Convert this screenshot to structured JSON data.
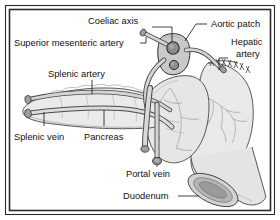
{
  "figure": {
    "kind": "anatomical-illustration",
    "frame": {
      "outer_color": "#2b2b2b",
      "inner_color": "#2b2b2b",
      "background": "#ffffff"
    },
    "palette": {
      "ink": "#111111",
      "outline": "#3c3c3c",
      "organ_fill_light": "#efefef",
      "organ_fill_mid": "#e2e2e2",
      "organ_fill_dark": "#cfcfcf",
      "vessel_fill": "#d8d8d8",
      "patch_fill": "#c6c6c6",
      "lumen_dark": "#8f8f8f"
    }
  },
  "labels": [
    {
      "id": "coeliac-axis",
      "text": "Coeliac axis"
    },
    {
      "id": "aortic-patch",
      "text": "Aortic patch"
    },
    {
      "id": "superior-mesenteric-artery",
      "text": "Superior mesenteric artery"
    },
    {
      "id": "hepatic-artery-line1",
      "text": "Hepatic"
    },
    {
      "id": "hepatic-artery-line2",
      "text": "artery"
    },
    {
      "id": "splenic-artery",
      "text": "Splenic artery"
    },
    {
      "id": "splenic-vein",
      "text": "Splenic vein"
    },
    {
      "id": "pancreas",
      "text": "Pancreas"
    },
    {
      "id": "portal-vein",
      "text": "Portal vein"
    },
    {
      "id": "duodenum",
      "text": "Duodenum"
    }
  ],
  "structures": [
    {
      "id": "pancreas-body",
      "name": "Pancreas body and tail"
    },
    {
      "id": "aortic-patch",
      "name": "Aortic patch with coeliac and SMA ostia"
    },
    {
      "id": "duodenum-loop",
      "name": "Duodenal loop, sutured proximal end, open distal cut end"
    },
    {
      "id": "splenic-vessels",
      "name": "Splenic artery and splenic vein cut stumps"
    },
    {
      "id": "portal-vein",
      "name": "Portal vein cut stump"
    },
    {
      "id": "hepatic-artery",
      "name": "Hepatic artery cut stump"
    }
  ]
}
